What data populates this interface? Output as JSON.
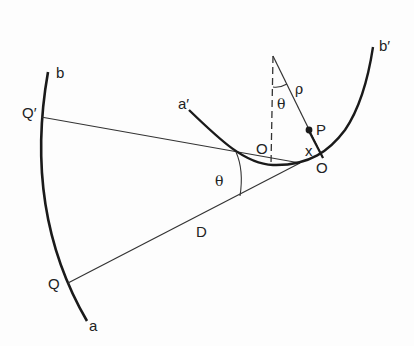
{
  "diagram": {
    "labels": {
      "a": "a",
      "b": "b",
      "a_prime": "a′",
      "b_prime": "b′",
      "Q": "Q",
      "Q_prime": "Q′",
      "O_center": "O",
      "O_right": "O",
      "P": "P",
      "x": "x",
      "rho": "ρ",
      "theta_top": "θ",
      "theta_bottom": "θ",
      "D": "D"
    },
    "colors": {
      "stroke": "#1a1a1a",
      "background": "#fdfdfd"
    }
  }
}
